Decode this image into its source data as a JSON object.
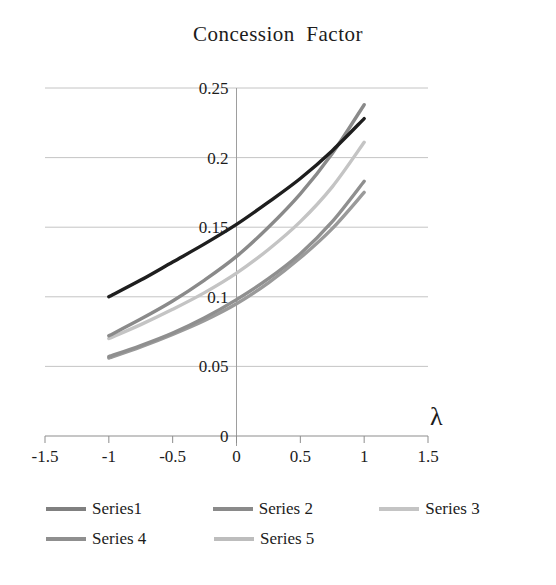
{
  "chart": {
    "title": "Concession  Factor",
    "axis_label_x": "λ",
    "axis_label_x_name": "lambda"
  },
  "legend": {
    "rows": [
      [
        {
          "label": "Series1",
          "color": "#808080"
        },
        {
          "label": "Series 2",
          "color": "#8a8a8a"
        },
        {
          "label": "Series 3",
          "color": "#c4c4c4"
        }
      ],
      [
        {
          "label": "Series 4",
          "color": "#8f8f8f"
        },
        {
          "label": "Series 5",
          "color": "#bdbdbd"
        }
      ]
    ]
  },
  "ticks": {
    "y": [
      "0.25",
      "0.2",
      "0.15",
      "0.1",
      "0.05",
      "0"
    ],
    "x": [
      "-1.5",
      "-1",
      "-0.5",
      "0",
      "0.5",
      "1",
      "1.5"
    ]
  },
  "chart_data": {
    "type": "line",
    "title": "Concession Factor",
    "xlabel": "λ",
    "ylabel": "",
    "xlim": [
      -1.5,
      1.5
    ],
    "ylim": [
      0,
      0.25
    ],
    "grid": true,
    "legend_position": "bottom",
    "x": [
      -1,
      -0.75,
      -0.5,
      -0.25,
      0,
      0.25,
      0.5,
      0.75,
      1
    ],
    "series": [
      {
        "name": "Series1",
        "color": "#1e1e1e",
        "values": [
          0.1,
          0.112,
          0.125,
          0.138,
          0.152,
          0.168,
          0.185,
          0.205,
          0.228
        ]
      },
      {
        "name": "Series 2",
        "color": "#8a8a8a",
        "values": [
          0.072,
          0.084,
          0.097,
          0.112,
          0.129,
          0.15,
          0.174,
          0.203,
          0.238
        ]
      },
      {
        "name": "Series 3",
        "color": "#c4c4c4",
        "values": [
          0.07,
          0.08,
          0.091,
          0.103,
          0.117,
          0.134,
          0.154,
          0.179,
          0.211
        ]
      },
      {
        "name": "Series 4",
        "color": "#8f8f8f",
        "values": [
          0.057,
          0.065,
          0.074,
          0.085,
          0.098,
          0.113,
          0.131,
          0.154,
          0.183
        ]
      },
      {
        "name": "Series 5",
        "color": "#9a9a9a",
        "values": [
          0.056,
          0.064,
          0.073,
          0.083,
          0.095,
          0.11,
          0.128,
          0.149,
          0.175
        ]
      }
    ]
  },
  "geometry": {
    "plot_left": 45,
    "plot_right": 428,
    "plot_top": 88,
    "plot_bottom": 436,
    "x_data_min": -1.5,
    "x_data_max": 1.5,
    "y_data_min": 0,
    "y_data_max": 0.25
  }
}
